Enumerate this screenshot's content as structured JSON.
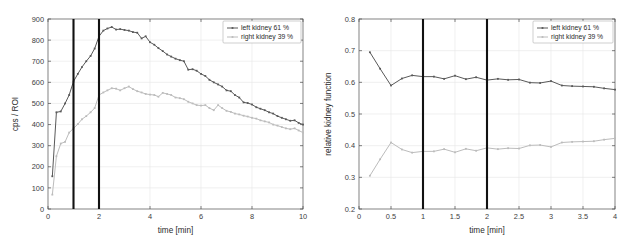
{
  "figure": {
    "background_color": "#ffffff",
    "panels": [
      "renogram",
      "relative-function"
    ]
  },
  "colors": {
    "left_kidney": "#595959",
    "right_kidney": "#bcbcbc",
    "marker_line": "#111111",
    "axis": "#4d4d4d",
    "grid": "#e6e6e6",
    "legend_border": "#b0b0b0"
  },
  "chart_data": [
    {
      "id": "renogram",
      "type": "line",
      "title": "",
      "xlabel": "time [min]",
      "ylabel": "cps / ROI",
      "xlim": [
        0,
        10
      ],
      "ylim": [
        0,
        900
      ],
      "xticks": [
        0,
        2,
        4,
        6,
        8,
        10
      ],
      "xtick_labels": [
        "0",
        "2",
        "4",
        "6",
        "8",
        "10"
      ],
      "yticks": [
        0,
        100,
        200,
        300,
        400,
        500,
        600,
        700,
        800,
        900
      ],
      "ytick_labels": [
        "0",
        "100",
        "200",
        "300",
        "400",
        "500",
        "600",
        "700",
        "800",
        "900"
      ],
      "grid": true,
      "legend_position": "top-right",
      "annotations": [
        {
          "type": "vline",
          "x": 1.0,
          "label": "marker-1min"
        },
        {
          "type": "vline",
          "x": 2.0,
          "label": "marker-2min"
        }
      ],
      "x": [
        0.17,
        0.33,
        0.5,
        0.67,
        0.83,
        1.0,
        1.17,
        1.33,
        1.5,
        1.67,
        1.83,
        2.0,
        2.17,
        2.33,
        2.5,
        2.67,
        2.83,
        3.0,
        3.17,
        3.33,
        3.5,
        3.67,
        3.83,
        4.0,
        4.17,
        4.33,
        4.5,
        4.67,
        4.83,
        5.0,
        5.17,
        5.33,
        5.5,
        5.67,
        5.83,
        6.0,
        6.17,
        6.33,
        6.5,
        6.67,
        6.83,
        7.0,
        7.17,
        7.33,
        7.5,
        7.67,
        7.83,
        8.0,
        8.17,
        8.33,
        8.5,
        8.67,
        8.83,
        9.0,
        9.17,
        9.33,
        9.5,
        9.67,
        9.83,
        10.0
      ],
      "series": [
        {
          "name": "left kidney 61 %",
          "color": "#595959",
          "values": [
            155,
            458,
            462,
            500,
            540,
            604,
            640,
            672,
            700,
            725,
            760,
            818,
            845,
            855,
            862,
            850,
            852,
            848,
            845,
            838,
            835,
            808,
            818,
            790,
            778,
            762,
            748,
            732,
            722,
            712,
            705,
            700,
            660,
            662,
            655,
            640,
            630,
            612,
            600,
            590,
            580,
            562,
            558,
            540,
            528,
            505,
            502,
            495,
            482,
            475,
            468,
            458,
            452,
            440,
            432,
            425,
            418,
            420,
            408,
            400
          ]
        },
        {
          "name": "right kidney 39 %",
          "color": "#bcbcbc",
          "values": [
            68,
            250,
            310,
            318,
            362,
            382,
            402,
            425,
            440,
            458,
            478,
            540,
            552,
            562,
            572,
            570,
            562,
            572,
            580,
            568,
            558,
            552,
            545,
            542,
            540,
            532,
            550,
            545,
            540,
            528,
            525,
            520,
            508,
            500,
            492,
            490,
            492,
            478,
            468,
            492,
            478,
            465,
            460,
            452,
            448,
            442,
            438,
            432,
            428,
            420,
            415,
            410,
            400,
            395,
            388,
            382,
            378,
            382,
            372,
            362
          ]
        }
      ]
    },
    {
      "id": "relative-function",
      "type": "line",
      "title": "",
      "xlabel": "time [min]",
      "ylabel": "relative kidney function",
      "xlim": [
        0,
        4
      ],
      "ylim": [
        0.2,
        0.8
      ],
      "xticks": [
        0,
        0.5,
        1,
        1.5,
        2,
        2.5,
        3,
        3.5,
        4
      ],
      "xtick_labels": [
        "0",
        "0.5",
        "1",
        "1.5",
        "2",
        "2.5",
        "3",
        "3.5",
        "4"
      ],
      "yticks": [
        0.2,
        0.3,
        0.4,
        0.5,
        0.6,
        0.7,
        0.8
      ],
      "ytick_labels": [
        "0.2",
        "0.3",
        "0.4",
        "0.5",
        "0.6",
        "0.7",
        "0.8"
      ],
      "grid": true,
      "legend_position": "top-right",
      "annotations": [
        {
          "type": "vline",
          "x": 1.0,
          "label": "marker-1min"
        },
        {
          "type": "vline",
          "x": 2.0,
          "label": "marker-2min"
        }
      ],
      "x": [
        0.17,
        0.33,
        0.5,
        0.67,
        0.83,
        1.0,
        1.17,
        1.33,
        1.5,
        1.67,
        1.83,
        2.0,
        2.17,
        2.33,
        2.5,
        2.67,
        2.83,
        3.0,
        3.17,
        3.33,
        3.5,
        3.67,
        3.83,
        4.0
      ],
      "series": [
        {
          "name": "left kidney 61 %",
          "color": "#595959",
          "values": [
            0.695,
            0.643,
            0.59,
            0.612,
            0.622,
            0.618,
            0.618,
            0.611,
            0.621,
            0.61,
            0.616,
            0.607,
            0.611,
            0.608,
            0.609,
            0.599,
            0.598,
            0.604,
            0.59,
            0.588,
            0.587,
            0.586,
            0.581,
            0.577
          ]
        },
        {
          "name": "right kidney 39 %",
          "color": "#bcbcbc",
          "values": [
            0.305,
            0.357,
            0.41,
            0.388,
            0.378,
            0.382,
            0.382,
            0.389,
            0.379,
            0.39,
            0.384,
            0.393,
            0.389,
            0.392,
            0.391,
            0.401,
            0.402,
            0.396,
            0.41,
            0.412,
            0.413,
            0.414,
            0.419,
            0.423
          ]
        }
      ]
    }
  ]
}
